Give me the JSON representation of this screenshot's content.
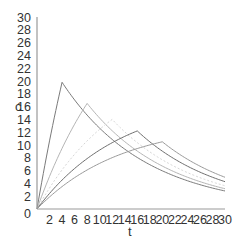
{
  "chart_data": {
    "type": "line",
    "title": "",
    "xlabel": "t",
    "ylabel": "c",
    "xlim": [
      0,
      30
    ],
    "ylim": [
      0,
      30
    ],
    "x_ticks": [
      2,
      4,
      6,
      8,
      10,
      12,
      14,
      16,
      18,
      20,
      22,
      24,
      26,
      28,
      30
    ],
    "y_ticks": [
      0,
      2,
      4,
      6,
      8,
      10,
      12,
      14,
      16,
      18,
      20,
      22,
      24,
      26,
      28,
      30
    ],
    "grid": false,
    "legend": null,
    "series": [
      {
        "name": "infusion T=4",
        "color": "#7a7a7a",
        "dash": "",
        "peak_t": 4,
        "peak_c": 19.8,
        "x": [
          0,
          4,
          8,
          12,
          16,
          20,
          24,
          28,
          30
        ],
        "values": [
          0,
          19.8,
          14.6,
          10.9,
          8.1,
          6.0,
          4.4,
          3.3,
          2.8
        ]
      },
      {
        "name": "infusion T=8",
        "color": "#b5b5b5",
        "dash": "",
        "peak_t": 8,
        "peak_c": 16.5,
        "x": [
          0,
          4,
          8,
          12,
          16,
          20,
          24,
          28,
          30
        ],
        "values": [
          0,
          9.1,
          16.5,
          12.2,
          9.0,
          6.7,
          5.0,
          3.7,
          3.2
        ]
      },
      {
        "name": "infusion T=12",
        "color": "#d6d6d6",
        "dash": "2,2",
        "peak_t": 12,
        "peak_c": 14.0,
        "x": [
          0,
          4,
          8,
          12,
          16,
          20,
          24,
          28,
          30
        ],
        "values": [
          0,
          6.0,
          10.7,
          14.0,
          10.4,
          7.7,
          5.7,
          4.2,
          3.6
        ]
      },
      {
        "name": "infusion T=16",
        "color": "#6e6e6e",
        "dash": "",
        "peak_t": 16,
        "peak_c": 12.2,
        "x": [
          0,
          4,
          8,
          12,
          16,
          20,
          24,
          28,
          30
        ],
        "values": [
          0,
          4.6,
          8.1,
          10.6,
          12.2,
          9.0,
          6.7,
          5.0,
          4.3
        ]
      },
      {
        "name": "infusion T=20",
        "color": "#9a9a9a",
        "dash": "",
        "peak_t": 20,
        "peak_c": 10.5,
        "x": [
          0,
          4,
          8,
          12,
          16,
          20,
          24,
          28,
          30
        ],
        "values": [
          0,
          3.5,
          6.2,
          8.2,
          9.6,
          10.5,
          7.8,
          5.8,
          5.0
        ]
      }
    ],
    "model": {
      "k": 0.075,
      "doses_note": "first-order infusion rise then exponential decay"
    }
  }
}
